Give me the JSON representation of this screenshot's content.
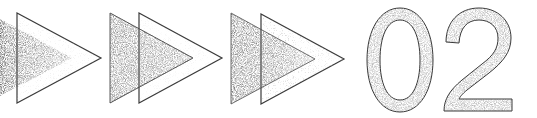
{
  "heading": {
    "number": "02",
    "arrow_count": 3,
    "description": "Section number graphic with three double-play arrows"
  },
  "colors": {
    "background": "#ffffff",
    "dark_fill": "#555555",
    "mid_fill": "#8c8c8c",
    "light_fill": "#bdbdbd",
    "outline": "#3a3a3a",
    "digit_fill": "#a3a3a3"
  },
  "arrows": [
    {
      "filled": {
        "points": "0,19 0,96 72,58"
      },
      "outline": {
        "points": "17,13 17,103 101,58"
      }
    },
    {
      "filled": {
        "points": "110,13 110,103 193,58"
      },
      "outline": {
        "points": "139,13 139,103 222,58"
      }
    },
    {
      "filled": {
        "points": "231,13 231,104 315,59"
      },
      "outline": {
        "points": "261,14 261,104 344,59"
      }
    }
  ]
}
